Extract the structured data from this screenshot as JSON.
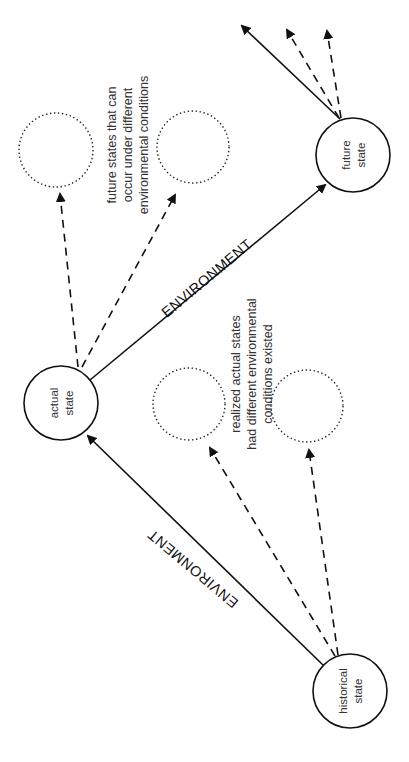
{
  "diagram": {
    "nodes": {
      "historical": {
        "line1": "historical",
        "line2": "state"
      },
      "actual": {
        "line1": "actual",
        "line2": "state"
      },
      "future": {
        "line1": "future",
        "line2": "state"
      }
    },
    "edges": {
      "historical_to_actual_label": "ENVIRONMENT",
      "actual_to_future_label": "ENVIRONMENT"
    },
    "annotations": {
      "future_alternatives": {
        "line1": "future states that can",
        "line2": "occur under different",
        "line3": "environmental conditions"
      },
      "realized_alternatives": {
        "line1": "realized actual states",
        "line2": "had different environmental",
        "line3": "conditions existed"
      }
    },
    "colors": {
      "stroke": "#111111",
      "background": "#ffffff",
      "text": "#333333"
    }
  }
}
